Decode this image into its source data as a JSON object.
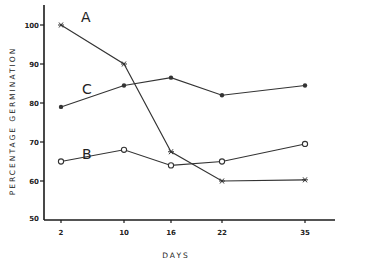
{
  "chart_data": {
    "type": "line",
    "title": "",
    "xlabel": "DAYS",
    "ylabel": "PERCENTAGE GERMINATION",
    "x": [
      2,
      10,
      16,
      22,
      35
    ],
    "x_tick_labels": [
      "2",
      "10",
      "16",
      "22",
      "35"
    ],
    "y_ticks": [
      50,
      60,
      70,
      80,
      90,
      100
    ],
    "y_tick_labels": [
      "50",
      "60",
      "70",
      "80",
      "90",
      "100"
    ],
    "ylim": [
      50,
      100
    ],
    "grid": false,
    "legend": "inline labels near start of each line",
    "series": [
      {
        "name": "A",
        "marker": "star",
        "values": [
          100,
          90,
          67.5,
          60,
          60.3
        ]
      },
      {
        "name": "B",
        "marker": "open-circle",
        "values": [
          65,
          68,
          64,
          65,
          69.5
        ]
      },
      {
        "name": "C",
        "marker": "filled-dot",
        "values": [
          79,
          84.5,
          86.5,
          82,
          84.5
        ]
      }
    ],
    "colors": {
      "line": "#333333",
      "axis": "#1a1a1a",
      "background": "#ffffff"
    }
  }
}
